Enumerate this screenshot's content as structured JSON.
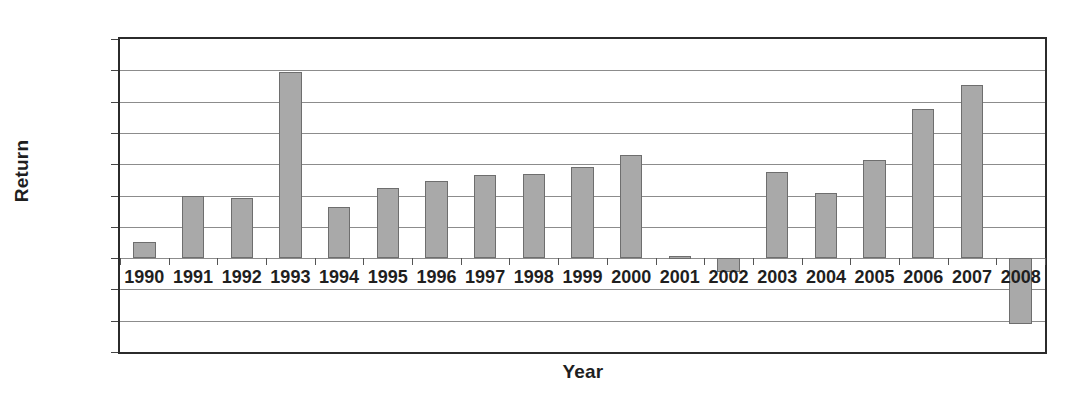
{
  "chart_data": {
    "type": "bar",
    "title": "",
    "xlabel": "Year",
    "ylabel": "Return",
    "categories": [
      "1990",
      "1991",
      "1992",
      "1993",
      "1994",
      "1995",
      "1996",
      "1997",
      "1998",
      "1999",
      "2000",
      "2001",
      "2002",
      "2003",
      "2004",
      "2005",
      "2006",
      "2007",
      "2008"
    ],
    "values": [
      0.025,
      0.1,
      0.096,
      0.297,
      0.082,
      0.112,
      0.123,
      0.133,
      0.134,
      0.145,
      0.165,
      0.003,
      -0.022,
      0.138,
      0.104,
      0.156,
      0.238,
      0.277,
      -0.105
    ],
    "ylim": [
      -0.15,
      0.35
    ],
    "yticks": [
      0.35,
      0.3,
      0.25,
      0.2,
      0.15,
      0.1,
      0.05,
      0,
      -0.05,
      -0.1,
      -0.15
    ],
    "ytick_labels": [
      "0.35",
      "0.3",
      "0.25",
      "0.2",
      "0.15",
      "0.1",
      "0.05",
      "0",
      "−0.05",
      "−0.1",
      "−0.15"
    ],
    "grid": true,
    "legend": null,
    "bar_color": "#a9a9a9",
    "bar_border_color": "#6e6e6e",
    "axis_color": "#2b2b2b",
    "grid_color": "#8c8c8c",
    "background": "#ffffff"
  }
}
